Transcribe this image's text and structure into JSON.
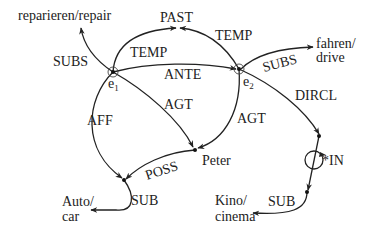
{
  "diagram": {
    "nodes": {
      "e1": {
        "label": "e",
        "sub": "1"
      },
      "e2": {
        "label": "e",
        "sub": "2"
      },
      "past": {
        "label": "PAST"
      },
      "repair": {
        "label": "reparieren/repair"
      },
      "drive_line1": {
        "label": "fahren/"
      },
      "drive_line2": {
        "label": "drive"
      },
      "peter": {
        "label": "Peter"
      },
      "auto_line1": {
        "label": "Auto/"
      },
      "auto_line2": {
        "label": "car"
      },
      "kino_line1": {
        "label": "Kino/"
      },
      "kino_line2": {
        "label": "cinema"
      }
    },
    "edges": {
      "e1_subs": "SUBS",
      "e1_temp": "TEMP",
      "e2_temp": "TEMP",
      "ante": "ANTE",
      "e2_subs": "SUBS",
      "e1_agt": "AGT",
      "e2_agt": "AGT",
      "aff": "AFF",
      "dircl": "DIRCL",
      "poss": "POSS",
      "auto_sub": "SUB",
      "in": "*IN",
      "kino_sub": "SUB"
    }
  }
}
